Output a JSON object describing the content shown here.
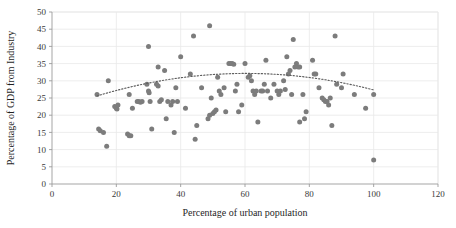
{
  "chart_data": {
    "type": "scatter",
    "title": "",
    "xlabel": "Percentage of urban population",
    "ylabel": "Percentage of GDP from Industry",
    "xlim": [
      0,
      120
    ],
    "ylim": [
      0,
      50
    ],
    "xticks": [
      0,
      20,
      40,
      60,
      80,
      100,
      120
    ],
    "yticks": [
      0,
      5,
      10,
      15,
      20,
      25,
      30,
      35,
      40,
      45,
      50
    ],
    "grid": "horizontal-and-vertical-light",
    "legend": "none",
    "marker_color": "#7c7c7c",
    "trendline": {
      "style": "dotted",
      "color": "#5e5e5e",
      "shape": "quadratic-concave-down",
      "description": "Dotted polynomial trendline rising from about 18.5 at x=14 to a peak near 29.5 around x=60, then declining to about 23 at x=100"
    },
    "points": [
      [
        14,
        26
      ],
      [
        14.5,
        16
      ],
      [
        15,
        15.5
      ],
      [
        16,
        15
      ],
      [
        17,
        11
      ],
      [
        17.5,
        30
      ],
      [
        19.5,
        22.5
      ],
      [
        20,
        22
      ],
      [
        20.2,
        21.8
      ],
      [
        20.5,
        23
      ],
      [
        23.5,
        14.5
      ],
      [
        24,
        26
      ],
      [
        24,
        14
      ],
      [
        24.5,
        14
      ],
      [
        25,
        22
      ],
      [
        26.5,
        24
      ],
      [
        27,
        24
      ],
      [
        27.5,
        23.8
      ],
      [
        28,
        24
      ],
      [
        29.5,
        29
      ],
      [
        30,
        40
      ],
      [
        30,
        27
      ],
      [
        30.2,
        26.5
      ],
      [
        30.5,
        24
      ],
      [
        31,
        16
      ],
      [
        32.5,
        29
      ],
      [
        33,
        28.5
      ],
      [
        33,
        34
      ],
      [
        33.5,
        24
      ],
      [
        34,
        24.5
      ],
      [
        35,
        33
      ],
      [
        35.5,
        19
      ],
      [
        36,
        24
      ],
      [
        37,
        23
      ],
      [
        37.5,
        24
      ],
      [
        38,
        15
      ],
      [
        38.5,
        28
      ],
      [
        39,
        24
      ],
      [
        40,
        37
      ],
      [
        41.5,
        22
      ],
      [
        43,
        32
      ],
      [
        44,
        43
      ],
      [
        44.5,
        13
      ],
      [
        45,
        17
      ],
      [
        46.5,
        28
      ],
      [
        48.5,
        19
      ],
      [
        49,
        20
      ],
      [
        49,
        46
      ],
      [
        49.5,
        25
      ],
      [
        50,
        20.5
      ],
      [
        50.5,
        21
      ],
      [
        51,
        21.5
      ],
      [
        51.5,
        31
      ],
      [
        52,
        27
      ],
      [
        52.5,
        26
      ],
      [
        53.5,
        28
      ],
      [
        54,
        21
      ],
      [
        55,
        35
      ],
      [
        55.5,
        35
      ],
      [
        56,
        35
      ],
      [
        56.5,
        34.8
      ],
      [
        57,
        27
      ],
      [
        57.5,
        29
      ],
      [
        58,
        21
      ],
      [
        59,
        23
      ],
      [
        60,
        35
      ],
      [
        61,
        31
      ],
      [
        61.5,
        31.5
      ],
      [
        62,
        30
      ],
      [
        62.5,
        27
      ],
      [
        63,
        26
      ],
      [
        63.5,
        27
      ],
      [
        64,
        18
      ],
      [
        65,
        27
      ],
      [
        65.5,
        27
      ],
      [
        66,
        29
      ],
      [
        66.5,
        36
      ],
      [
        67,
        27
      ],
      [
        68,
        25
      ],
      [
        69,
        29
      ],
      [
        70,
        27
      ],
      [
        70.5,
        26
      ],
      [
        71,
        27
      ],
      [
        72,
        30
      ],
      [
        72.5,
        27.5
      ],
      [
        73,
        37
      ],
      [
        73.5,
        32
      ],
      [
        74,
        33
      ],
      [
        74.5,
        26
      ],
      [
        75,
        42
      ],
      [
        75.5,
        34
      ],
      [
        76,
        35
      ],
      [
        76.5,
        34
      ],
      [
        77,
        34
      ],
      [
        77,
        18
      ],
      [
        78,
        26
      ],
      [
        78.5,
        19
      ],
      [
        79,
        21
      ],
      [
        81,
        36
      ],
      [
        81.5,
        32
      ],
      [
        82,
        32
      ],
      [
        83,
        28
      ],
      [
        84,
        25
      ],
      [
        84.5,
        24.5
      ],
      [
        85,
        24
      ],
      [
        85.5,
        24
      ],
      [
        86,
        23
      ],
      [
        86.5,
        25
      ],
      [
        87,
        17
      ],
      [
        88,
        43
      ],
      [
        88.5,
        29
      ],
      [
        90,
        28
      ],
      [
        90.5,
        32
      ],
      [
        94,
        26
      ],
      [
        97.5,
        22
      ],
      [
        100,
        26
      ],
      [
        100,
        7
      ]
    ]
  },
  "axes": {
    "x_tick_labels": [
      "0",
      "20",
      "40",
      "60",
      "80",
      "100",
      "120"
    ],
    "y_tick_labels": [
      "0",
      "5",
      "10",
      "15",
      "20",
      "25",
      "30",
      "35",
      "40",
      "45",
      "50"
    ]
  }
}
